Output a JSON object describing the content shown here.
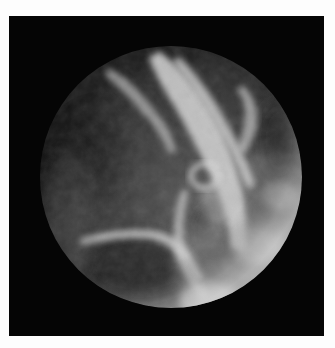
{
  "image": {
    "subject": "planet-earth-from-space",
    "style": "grayscale photograph",
    "colors": {
      "frame": "#fdfdfd",
      "space": "#050505",
      "planet_dark": "#2a2a2a",
      "planet_mid": "#6e6e6e",
      "cloud_bright": "#e6e6e6"
    }
  }
}
